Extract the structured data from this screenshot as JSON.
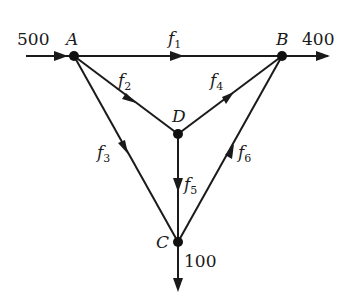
{
  "diagram": {
    "type": "network-flow",
    "nodes": [
      {
        "id": "A",
        "label": "A",
        "x": 74,
        "y": 56
      },
      {
        "id": "B",
        "label": "B",
        "x": 282,
        "y": 56
      },
      {
        "id": "D",
        "label": "D",
        "x": 178,
        "y": 134
      },
      {
        "id": "C",
        "label": "C",
        "x": 178,
        "y": 242
      }
    ],
    "edges": [
      {
        "id": "f1",
        "from": "A",
        "to": "B",
        "label": "f",
        "sub": "1"
      },
      {
        "id": "f2",
        "from": "A",
        "to": "D",
        "label": "f",
        "sub": "2"
      },
      {
        "id": "f3",
        "from": "A",
        "to": "C",
        "label": "f",
        "sub": "3"
      },
      {
        "id": "f4",
        "from": "D",
        "to": "B",
        "label": "f",
        "sub": "4"
      },
      {
        "id": "f5",
        "from": "D",
        "to": "C",
        "label": "f",
        "sub": "5"
      },
      {
        "id": "f6",
        "from": "C",
        "to": "B",
        "label": "f",
        "sub": "6"
      }
    ],
    "external_flows": [
      {
        "id": "in-A",
        "node": "A",
        "direction": "in",
        "value": "500"
      },
      {
        "id": "out-B",
        "node": "B",
        "direction": "out",
        "value": "400"
      },
      {
        "id": "out-C",
        "node": "C",
        "direction": "out",
        "value": "100"
      }
    ],
    "colors": {
      "ink": "#1a1a1a",
      "background": "#ffffff"
    }
  }
}
